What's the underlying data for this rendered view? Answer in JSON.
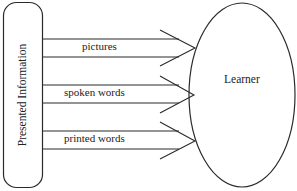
{
  "source": {
    "label": "Presented Information"
  },
  "target": {
    "label": "Learner"
  },
  "channels": [
    {
      "label": "pictures"
    },
    {
      "label": "spoken words"
    },
    {
      "label": "printed words"
    }
  ],
  "colors": {
    "stroke": "#2a2a2a",
    "background": "#ffffff"
  }
}
